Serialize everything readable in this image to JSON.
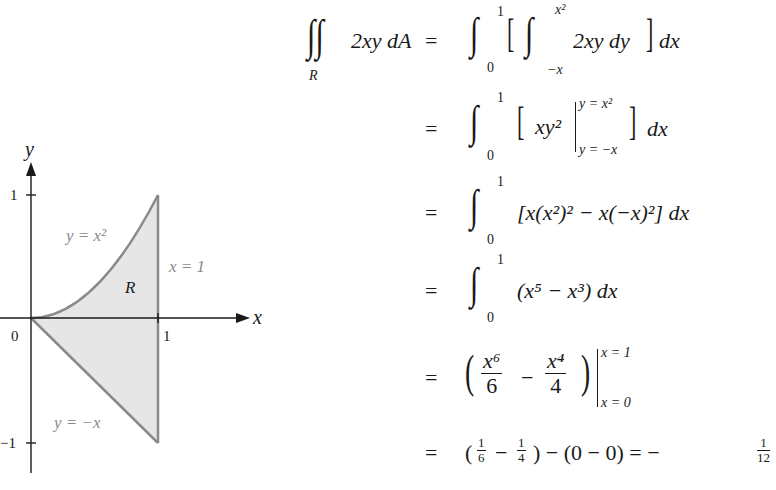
{
  "figure": {
    "axis_x_label": "x",
    "axis_y_label": "y",
    "tick_x_1": "1",
    "tick_origin": "0",
    "tick_y_1": "1",
    "tick_y_neg1": "−1",
    "region_label": "R",
    "curve_upper_label": "y = x²",
    "curve_lower_label": "y = −x",
    "boundary_right_label": "x = 1",
    "fill_color": "#e6e6e6",
    "curve_color": "#8a8a8a"
  },
  "derivation": {
    "line1": {
      "lhs_integrand": "2xy dA",
      "lhs_region": "R",
      "outer_lower": "0",
      "outer_upper": "1",
      "inner_lower": "−x",
      "inner_upper": "x²",
      "inner_integrand": "2xy dy",
      "outer_diff": "dx"
    },
    "line2": {
      "outer_lower": "0",
      "outer_upper": "1",
      "expr": "xy²",
      "eval_upper": "y = x²",
      "eval_lower": "y = −x",
      "diff": "dx"
    },
    "line3": {
      "outer_lower": "0",
      "outer_upper": "1",
      "expr": "[x(x²)² − x(−x)²] dx"
    },
    "line4": {
      "outer_lower": "0",
      "outer_upper": "1",
      "expr": "(x⁵ − x³) dx"
    },
    "line5": {
      "frac1_num": "x⁶",
      "frac1_den": "6",
      "minus": "−",
      "frac2_num": "x⁴",
      "frac2_den": "4",
      "eval_upper": "x = 1",
      "eval_lower": "x = 0"
    },
    "line6": {
      "part1": "(",
      "f1_num": "1",
      "f1_den": "6",
      "minus1": "−",
      "f2_num": "1",
      "f2_den": "4",
      "part2": ") − (0 − 0) = −",
      "result_num": "1",
      "result_den": "12"
    },
    "equals": "="
  }
}
